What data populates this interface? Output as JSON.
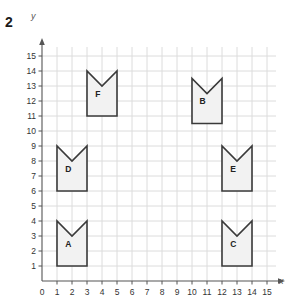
{
  "question_number": "2",
  "axes": {
    "x_label": "x",
    "y_label": "y",
    "x_ticks": [
      "0",
      "1",
      "2",
      "3",
      "4",
      "5",
      "6",
      "7",
      "8",
      "9",
      "10",
      "11",
      "12",
      "13",
      "14",
      "15"
    ],
    "y_ticks": [
      "0",
      "1",
      "2",
      "3",
      "4",
      "5",
      "6",
      "7",
      "8",
      "9",
      "10",
      "11",
      "12",
      "13",
      "14",
      "15"
    ],
    "x_range": [
      0,
      15
    ],
    "y_range": [
      0,
      15
    ],
    "grid": true,
    "origin_label": "0"
  },
  "style": {
    "grid_color": "#dcdcdc",
    "axis_color": "#555555",
    "shape_stroke": "#3a3a3a",
    "shape_fill": "#f2f2f2",
    "text_color": "#333333"
  },
  "chart_data": {
    "type": "scatter",
    "title": "",
    "xlabel": "x",
    "ylabel": "y",
    "xlim": [
      0,
      15
    ],
    "ylim": [
      0,
      15
    ],
    "grid": true,
    "shapes": [
      {
        "label": "A",
        "left": 1,
        "right": 3,
        "bottom": 1,
        "top": 4,
        "notch_x": 2,
        "notch_y": 3,
        "label_x": 1.55,
        "label_y": 2.3,
        "points": "1,1 3,1 3,4 2,3 1,4"
      },
      {
        "label": "B",
        "left": 10,
        "right": 12,
        "bottom": 10.5,
        "top": 13.5,
        "notch_x": 11,
        "notch_y": 12.5,
        "label_x": 10.5,
        "label_y": 11.8,
        "points": "10,10.5 12,10.5 12,13.5 11,12.5 10,13.5"
      },
      {
        "label": "C",
        "left": 12,
        "right": 14,
        "bottom": 1,
        "top": 4,
        "notch_x": 13,
        "notch_y": 3,
        "label_x": 12.55,
        "label_y": 2.3,
        "points": "12,1 14,1 14,4 13,3 12,4"
      },
      {
        "label": "D",
        "left": 1,
        "right": 3,
        "bottom": 6,
        "top": 9,
        "notch_x": 2,
        "notch_y": 8,
        "label_x": 1.55,
        "label_y": 7.3,
        "points": "1,6 3,6 3,9 2,8 1,9"
      },
      {
        "label": "E",
        "left": 12,
        "right": 14,
        "bottom": 6,
        "top": 9,
        "notch_x": 13,
        "notch_y": 8,
        "label_x": 12.55,
        "label_y": 7.3,
        "points": "12,6 14,6 14,9 13,8 12,9"
      },
      {
        "label": "F",
        "left": 3,
        "right": 5,
        "bottom": 11,
        "top": 14,
        "notch_x": 4,
        "notch_y": 13,
        "label_x": 3.55,
        "label_y": 12.3,
        "points": "3,11 5,11 5,14 4,13 3,14"
      }
    ]
  }
}
